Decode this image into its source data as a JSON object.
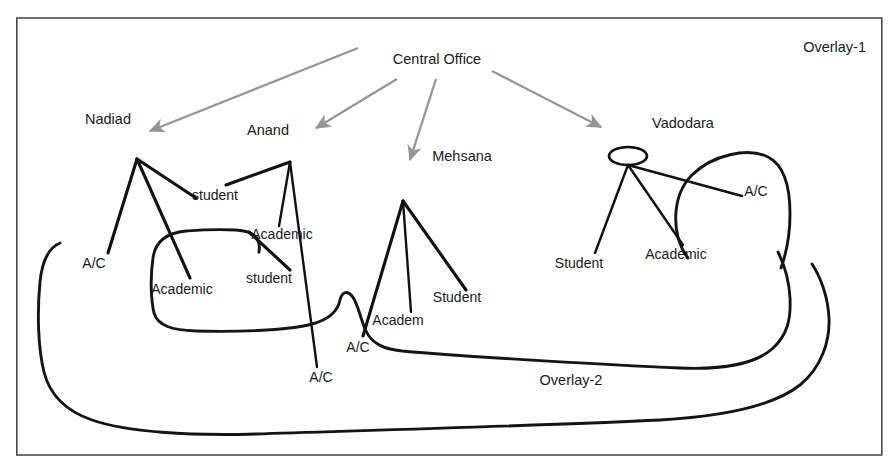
{
  "figure": {
    "frame": {
      "x": 16,
      "y": 18,
      "width": 866,
      "height": 437
    },
    "background_color": "#ffffff",
    "frame_color": "#4a4a4a",
    "arrow_color": "#959595",
    "line_color": "#141414"
  },
  "overlays": [
    {
      "id": "overlay-1",
      "label": "Overlay-1",
      "x": 866,
      "y": 52
    },
    {
      "id": "overlay-2",
      "label": "Overlay-2",
      "x": 571,
      "y": 385
    }
  ],
  "root": {
    "label": "Central Office",
    "x": 437,
    "y": 64
  },
  "sites": [
    {
      "id": "nadiad",
      "label": "Nadiad",
      "label_x": 108,
      "label_y": 124,
      "node_x": 137,
      "node_y": 159,
      "has_ellipse": false,
      "children": [
        {
          "label": "A/C",
          "x": 94,
          "y": 268
        },
        {
          "label": "Academic",
          "x": 182,
          "y": 294
        },
        {
          "label": "student",
          "x": 215,
          "y": 200
        }
      ]
    },
    {
      "id": "anand",
      "label": "Anand",
      "label_x": 268,
      "label_y": 135,
      "node_x": 290,
      "node_y": 162,
      "has_ellipse": false,
      "children": [
        {
          "label": "student",
          "x": 269,
          "y": 283
        },
        {
          "label": "Academic",
          "x": 282,
          "y": 239
        },
        {
          "label": "A/C",
          "x": 321,
          "y": 382
        }
      ]
    },
    {
      "id": "mehsana",
      "label": "Mehsana",
      "label_x": 462,
      "label_y": 161,
      "node_x": 403,
      "node_y": 201,
      "has_ellipse": false,
      "children": [
        {
          "label": "A/C",
          "x": 358,
          "y": 350
        },
        {
          "label": "Academ",
          "x": 396,
          "y": 325
        },
        {
          "label": "Student",
          "x": 457,
          "y": 302
        }
      ]
    },
    {
      "id": "vadodara",
      "label": "Vadodara",
      "label_x": 683,
      "label_y": 128,
      "node_x": 628,
      "node_y": 163,
      "has_ellipse": true,
      "ellipse_rx": 19,
      "ellipse_ry": 9,
      "children": [
        {
          "label": "Student",
          "x": 579,
          "y": 268
        },
        {
          "label": "Academic",
          "x": 676,
          "y": 259
        },
        {
          "label": "A/C",
          "x": 756,
          "y": 196
        }
      ]
    }
  ],
  "arrows": [
    {
      "id": "arrow-to-nadiad",
      "x1": 358,
      "y1": 48,
      "x2": 146,
      "y2": 133
    },
    {
      "id": "arrow-to-anand",
      "x1": 396,
      "y1": 80,
      "x2": 311,
      "y2": 131
    },
    {
      "id": "arrow-to-mehsana",
      "x1": 436,
      "y1": 80,
      "x2": 409,
      "y2": 163
    },
    {
      "id": "arrow-to-vadodara",
      "x1": 490,
      "y1": 72,
      "x2": 606,
      "y2": 131
    }
  ],
  "icons": {
    "arrowhead": "arrowhead-icon",
    "node": "node-ellipse-icon"
  }
}
